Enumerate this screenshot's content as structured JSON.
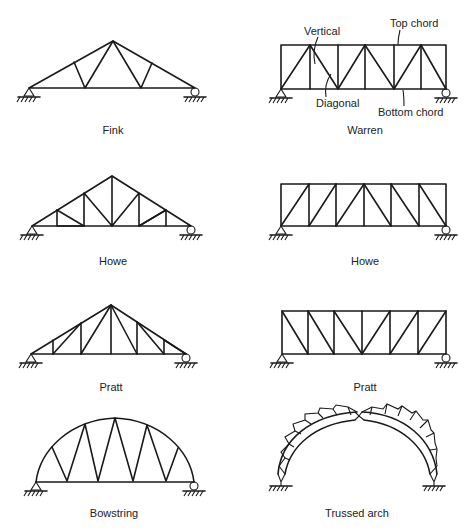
{
  "figure": {
    "background": "#ffffff",
    "line_color": "#1a1a1a"
  },
  "trusses": [
    {
      "id": "fink",
      "caption": "Fink",
      "kind": "roof"
    },
    {
      "id": "warren",
      "caption": "Warren",
      "kind": "bridge",
      "annotations": {
        "vertical": "Vertical",
        "top_chord": "Top chord",
        "diagonal": "Diagonal",
        "bottom_chord": "Bottom chord"
      }
    },
    {
      "id": "howe-roof",
      "caption": "Howe",
      "kind": "roof"
    },
    {
      "id": "howe-bridge",
      "caption": "Howe",
      "kind": "bridge"
    },
    {
      "id": "pratt-roof",
      "caption": "Pratt",
      "kind": "roof"
    },
    {
      "id": "pratt-bridge",
      "caption": "Pratt",
      "kind": "bridge"
    },
    {
      "id": "bowstring",
      "caption": "Bowstring",
      "kind": "arch"
    },
    {
      "id": "trussed-arch",
      "caption": "Trussed arch",
      "kind": "arch"
    }
  ]
}
